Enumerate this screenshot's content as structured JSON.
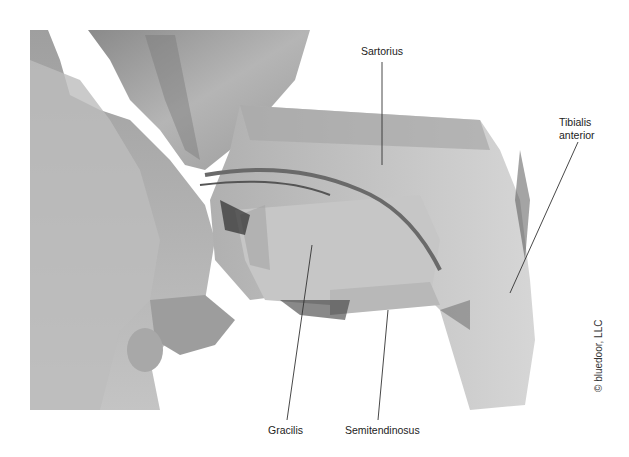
{
  "figure": {
    "labels": {
      "sartorius": "Sartorius",
      "tibialis_anterior_line1": "Tibialis",
      "tibialis_anterior_line2": "anterior",
      "gracilis": "Gracilis",
      "semitendinosus": "Semitendinosus"
    },
    "credit": "© bluedoor, LLC",
    "colors": {
      "background": "#ffffff",
      "leader_line": "#333333",
      "label_text": "#222222"
    }
  }
}
